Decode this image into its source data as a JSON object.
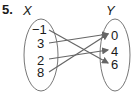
{
  "problem_number": "5.",
  "domain_set": {
    "label": "X",
    "values": [
      "−1",
      "3",
      "2",
      "8"
    ]
  },
  "range_set": {
    "label": "Y",
    "values": [
      "0",
      "4",
      "6"
    ]
  },
  "mappings": [
    {
      "from": "−1",
      "to": "6"
    },
    {
      "from": "3",
      "to": "0"
    },
    {
      "from": "2",
      "to": "4"
    },
    {
      "from": "8",
      "to": "0"
    }
  ],
  "colors": {
    "ellipse": "#777777",
    "arrow": "#666666",
    "text": "#1a1a1a"
  }
}
